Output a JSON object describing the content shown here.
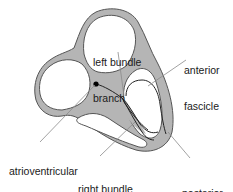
{
  "diagram": {
    "colors": {
      "wall_fill": "#b5b5b5",
      "wall_stroke": "#555555",
      "conduction_path": "#222222",
      "leader_line": "#8a8a8a",
      "node_dot": "#000000",
      "text": "#1a1a1a"
    },
    "labels": {
      "left_bundle_branch": {
        "line1": "left bundle",
        "line2": "branch"
      },
      "anterior_fascicle": {
        "line1": "anterior",
        "line2": "fascicle"
      },
      "atrioventricular_node": {
        "line1": "atrioventricular",
        "line2": "node"
      },
      "right_bundle_branch": {
        "line1": "right bundle",
        "line2": "branch"
      },
      "posterior_fascicle": {
        "line1": "posterior",
        "line2": "fascicle"
      }
    }
  }
}
